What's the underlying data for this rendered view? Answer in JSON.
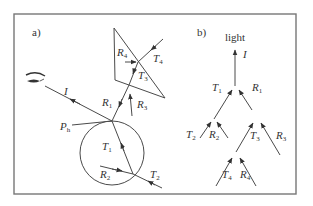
{
  "figure": {
    "panel_a": {
      "label": "a)",
      "labels": {
        "I": "I",
        "Ph_main": "P",
        "Ph_sub": "h",
        "R1_main": "R",
        "R1_sub": "1",
        "R2_main": "R",
        "R2_sub": "2",
        "R3_main": "R",
        "R3_sub": "3",
        "R4_main": "R",
        "R4_sub": "4",
        "T1_main": "T",
        "T1_sub": "1",
        "T2_main": "T",
        "T2_sub": "2",
        "T3_main": "T",
        "T3_sub": "3",
        "T4_main": "T",
        "T4_sub": "4"
      },
      "elements": [
        "eye",
        "circle (sphere particle)",
        "triangle (prism crystal)",
        "ray paths with arrows"
      ]
    },
    "panel_b": {
      "label": "b)",
      "root": "light",
      "tree": {
        "I": "I",
        "T1_main": "T",
        "T1_sub": "1",
        "R1_main": "R",
        "R1_sub": "1",
        "T2_main": "T",
        "T2_sub": "2",
        "R2_main": "R",
        "R2_sub": "2",
        "T3_main": "T",
        "T3_sub": "3",
        "R3_main": "R",
        "R3_sub": "3",
        "T4_main": "T",
        "T4_sub": "4",
        "R4_main": "R",
        "R4_sub": "4"
      }
    },
    "colors": {
      "line": "#4a4a4a",
      "frame": "#777777",
      "text": "#333333",
      "background": "#ffffff"
    }
  }
}
